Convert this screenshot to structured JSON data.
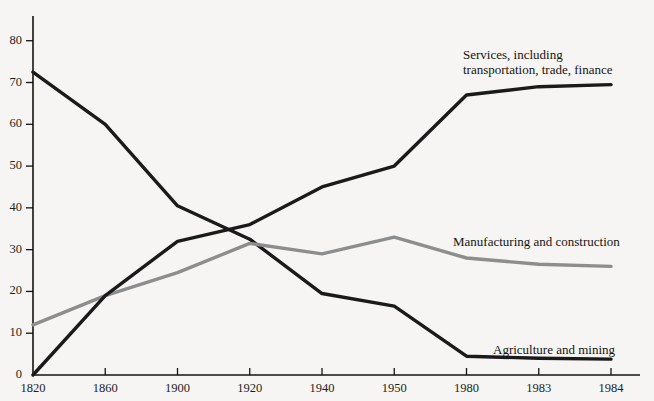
{
  "chart_data": {
    "type": "line",
    "title": "",
    "subtitle": "",
    "xlabel": "",
    "ylabel": "",
    "categories": [
      "1820",
      "1860",
      "1900",
      "1920",
      "1940",
      "1950",
      "1980",
      "1983",
      "1984"
    ],
    "x_tick_labels": [
      "1820",
      "1860",
      "1900",
      "1920",
      "1940",
      "1950",
      "1980",
      "1983",
      "1984"
    ],
    "y_tick_labels": [
      "0",
      "10",
      "20",
      "30",
      "40",
      "50",
      "60",
      "70",
      "80"
    ],
    "y_ticks": [
      0,
      10,
      20,
      30,
      40,
      50,
      60,
      70,
      80
    ],
    "ylim": [
      0,
      84
    ],
    "grid": false,
    "legend_position": "inline-annotations",
    "axis_color": "#14130f",
    "background_color": "#f6f5f3",
    "series": [
      {
        "name": "Agriculture and mining",
        "label": "Agriculture and mining",
        "color": "#1a1a1a",
        "width": 3.4,
        "values": [
          72.5,
          60,
          40.5,
          32.5,
          19.5,
          16.5,
          4.5,
          4,
          3.8
        ],
        "annotation": {
          "x": 493,
          "y": 342
        }
      },
      {
        "name": "Manufacturing and construction",
        "label": "Manufacturing and construction",
        "color": "#8d8d8d",
        "width": 3.4,
        "values": [
          12,
          19,
          24.5,
          31.5,
          29,
          33,
          28,
          26.5,
          26
        ],
        "annotation": {
          "x": 453,
          "y": 234
        }
      },
      {
        "name": "Services, including transportation, trade, finance",
        "label": "Services, including\ntransportation, trade, finance",
        "color": "#1a1a1a",
        "width": 3.4,
        "values": [
          0,
          19,
          32,
          36,
          45,
          50,
          67,
          69,
          69.5
        ],
        "annotation": {
          "x": 463,
          "y": 47
        }
      }
    ]
  }
}
